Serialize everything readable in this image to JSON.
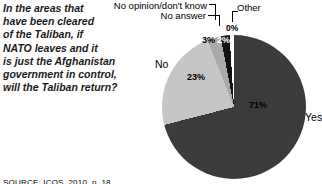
{
  "question": {
    "lines": [
      "In the areas that",
      "have been cleared",
      "of the Taliban, if",
      "NATO leaves and it",
      "is just the Afghanistan",
      "government in control,",
      "will the Taliban return?"
    ]
  },
  "source": "SOURCE: ICOS, 2010, p. 18",
  "chart_data": {
    "type": "pie",
    "title": "",
    "question": "In the areas that have been cleared of the Taliban, if NATO leaves and it is just the Afghanistan government in control, will the Taliban return?",
    "unit": "percent",
    "direction": "clockwise",
    "start_angle_deg": 0,
    "legend_position": "callouts",
    "slices": [
      {
        "label": "Yes",
        "value": 71,
        "pct_label": "71%",
        "color": "#3b3b3b"
      },
      {
        "label": "No",
        "value": 23,
        "pct_label": "23%",
        "color": "#c6c6c6"
      },
      {
        "label": "No opinion/don't know",
        "value": 3,
        "pct_label": "3%",
        "color": "#aaaaaa"
      },
      {
        "label": "No answer",
        "value": 2,
        "pct_label": "2%",
        "color": "#121212"
      },
      {
        "label": "Other",
        "value": 0,
        "pct_label": "0%",
        "color": "#ffffff"
      }
    ]
  }
}
